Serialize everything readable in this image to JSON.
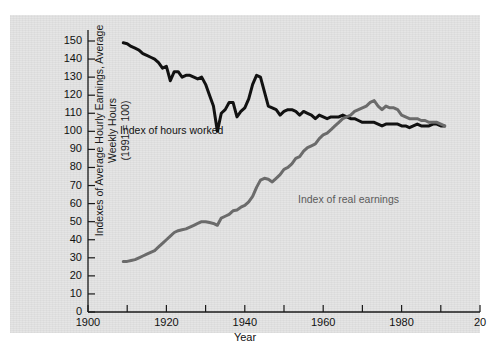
{
  "chart_data": {
    "type": "line",
    "title": "",
    "xlabel": "Year",
    "ylabel": "Indexes of Average Hourly Earnings, Average Weekly Hours\n(1991 = 100)",
    "xlim": [
      1900,
      2000
    ],
    "ylim": [
      0,
      150
    ],
    "xticks": [
      1900,
      1910,
      1920,
      1930,
      1940,
      1950,
      1960,
      1970,
      1980,
      1990,
      2000
    ],
    "xtick_labels": [
      "1900",
      "",
      "1920",
      "",
      "1940",
      "",
      "1960",
      "",
      "1980",
      "",
      "20"
    ],
    "yticks": [
      0,
      10,
      20,
      30,
      40,
      50,
      60,
      70,
      80,
      90,
      100,
      110,
      120,
      130,
      140,
      150
    ],
    "grid": false,
    "legend_position": "inline-annotations",
    "series": [
      {
        "name": "Index of hours worked",
        "color": "#111111",
        "label_text": "Index of hours worked",
        "x": [
          1909,
          1910,
          1911,
          1912,
          1913,
          1914,
          1915,
          1916,
          1917,
          1918,
          1919,
          1920,
          1921,
          1922,
          1923,
          1924,
          1925,
          1926,
          1927,
          1928,
          1929,
          1930,
          1931,
          1932,
          1933,
          1934,
          1935,
          1936,
          1937,
          1938,
          1939,
          1940,
          1941,
          1942,
          1943,
          1944,
          1945,
          1946,
          1947,
          1948,
          1949,
          1950,
          1951,
          1952,
          1953,
          1954,
          1955,
          1956,
          1957,
          1958,
          1959,
          1960,
          1961,
          1962,
          1963,
          1964,
          1965,
          1966,
          1967,
          1968,
          1969,
          1970,
          1971,
          1972,
          1973,
          1974,
          1975,
          1976,
          1977,
          1978,
          1979,
          1980,
          1981,
          1982,
          1983,
          1984,
          1985,
          1986,
          1987,
          1988,
          1989,
          1990,
          1991
        ],
        "y": [
          149,
          148.5,
          147,
          146,
          145,
          143,
          142,
          141,
          140,
          138,
          135,
          136,
          128,
          133,
          133,
          130,
          131,
          131,
          130,
          129,
          130,
          126,
          120,
          114,
          100,
          110,
          112,
          116,
          116,
          108,
          111,
          113,
          118,
          126,
          131,
          130,
          122,
          114,
          113,
          112,
          109,
          111,
          112,
          112,
          111,
          109,
          111,
          110,
          109,
          107,
          109,
          108,
          107,
          108,
          108,
          108,
          109,
          108,
          107,
          107,
          106,
          105,
          105,
          105,
          105,
          104,
          103,
          104,
          104,
          104,
          104,
          103,
          103,
          102,
          103,
          104,
          103,
          103,
          103,
          104,
          104,
          103,
          103
        ]
      },
      {
        "name": "Index of real earnings",
        "color": "#6b6b6b",
        "label_text": "Index of real earnings",
        "x": [
          1909,
          1910,
          1911,
          1912,
          1913,
          1914,
          1915,
          1916,
          1917,
          1918,
          1919,
          1920,
          1921,
          1922,
          1923,
          1924,
          1925,
          1926,
          1927,
          1928,
          1929,
          1930,
          1931,
          1932,
          1933,
          1934,
          1935,
          1936,
          1937,
          1938,
          1939,
          1940,
          1941,
          1942,
          1943,
          1944,
          1945,
          1946,
          1947,
          1948,
          1949,
          1950,
          1951,
          1952,
          1953,
          1954,
          1955,
          1956,
          1957,
          1958,
          1959,
          1960,
          1961,
          1962,
          1963,
          1964,
          1965,
          1966,
          1967,
          1968,
          1969,
          1970,
          1971,
          1972,
          1973,
          1974,
          1975,
          1976,
          1977,
          1978,
          1979,
          1980,
          1981,
          1982,
          1983,
          1984,
          1985,
          1986,
          1987,
          1988,
          1989,
          1990,
          1991
        ],
        "y": [
          28,
          28,
          28.5,
          29,
          30,
          31,
          32,
          33,
          34,
          36,
          38,
          40,
          42,
          44,
          45,
          45.5,
          46,
          47,
          48,
          49,
          50,
          50,
          49.5,
          49,
          48,
          52,
          53,
          54,
          56,
          56.5,
          58,
          59,
          61,
          64,
          69,
          73,
          74,
          73.5,
          72,
          74,
          76,
          79,
          80,
          82,
          85,
          86,
          89,
          91,
          92,
          93,
          96,
          98,
          99,
          101,
          103,
          105,
          107,
          108,
          109,
          111,
          112,
          113,
          114,
          116,
          117,
          114,
          112,
          114,
          113,
          113,
          112,
          109,
          108,
          107,
          107,
          107,
          106,
          106,
          105,
          105,
          105,
          104,
          103
        ]
      }
    ],
    "annotations": [
      {
        "text": "Index of hours worked",
        "series": "hours"
      },
      {
        "text": "Index of real earnings",
        "series": "earnings"
      }
    ]
  }
}
